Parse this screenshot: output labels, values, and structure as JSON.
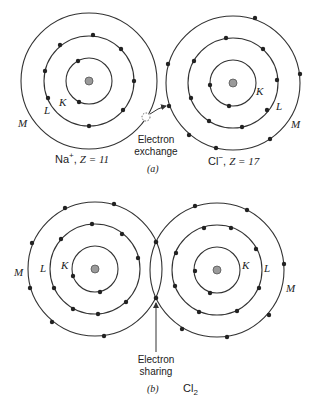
{
  "colors": {
    "line": "#333333",
    "electron": "#222222",
    "nucleus": "#9a9a9a",
    "background": "#ffffff"
  },
  "part_a": {
    "tag": "(a)",
    "caption": [
      "Electron",
      "exchange"
    ],
    "left_atom": {
      "ion": "Na",
      "charge": "+",
      "z_label": "Z = 11",
      "shells": {
        "K": "K",
        "L": "L",
        "M": "M"
      },
      "center": [
        89,
        81
      ],
      "radii": [
        23,
        45,
        68
      ],
      "electron_counts": {
        "K": 2,
        "L": 8,
        "M": 0,
        "vacated": 1
      }
    },
    "right_atom": {
      "ion": "Cl",
      "charge": "−",
      "z_label": "Z = 17",
      "shells": {
        "K": "K",
        "L": "L",
        "M": "M"
      },
      "center": [
        233,
        83
      ],
      "radii": [
        23,
        45,
        67
      ],
      "electron_counts": {
        "K": 2,
        "L": 8,
        "M": 8
      }
    }
  },
  "part_b": {
    "tag": "(b)",
    "molecule": "Cl",
    "subscript": "2",
    "caption": [
      "Electron",
      "sharing"
    ],
    "left_atom": {
      "shells": {
        "K": "K",
        "L": "L",
        "M": "M"
      },
      "center": [
        95,
        269
      ],
      "radii": [
        23,
        45,
        67
      ],
      "electron_counts": {
        "K": 2,
        "L": 8,
        "M": 7
      }
    },
    "right_atom": {
      "shells": {
        "K": "K",
        "L": "L",
        "M": "M"
      },
      "center": [
        217,
        270
      ],
      "radii": [
        23,
        45,
        67
      ],
      "electron_counts": {
        "K": 2,
        "L": 8,
        "M": 7
      }
    },
    "shared_electrons": 2
  }
}
